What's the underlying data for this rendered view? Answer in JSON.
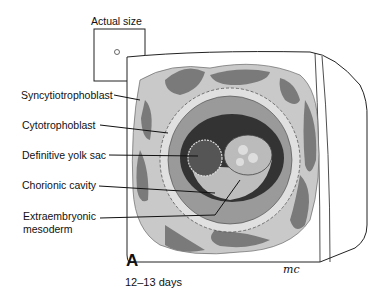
{
  "figure": {
    "actual_size_label": "Actual size",
    "panel_letter": "A",
    "caption": "12–13 days",
    "signature": "mc",
    "labels": [
      {
        "text": "Syncytiotrophoblast",
        "x": 21,
        "y": 89
      },
      {
        "text": "Cytotrophoblast",
        "x": 22,
        "y": 120
      },
      {
        "text": "Definitive yolk sac",
        "x": 22,
        "y": 150
      },
      {
        "text": "Chorionic cavity",
        "x": 22,
        "y": 180
      },
      {
        "text": "Extraembryonic",
        "x": 23,
        "y": 210
      },
      {
        "text": "mesoderm",
        "x": 23,
        "y": 223
      }
    ],
    "colors": {
      "tissue_dark": "#7a7a7a",
      "tissue_light": "#c8c8c8",
      "cavity": "#3a3a3a",
      "outline": "#222222"
    }
  }
}
